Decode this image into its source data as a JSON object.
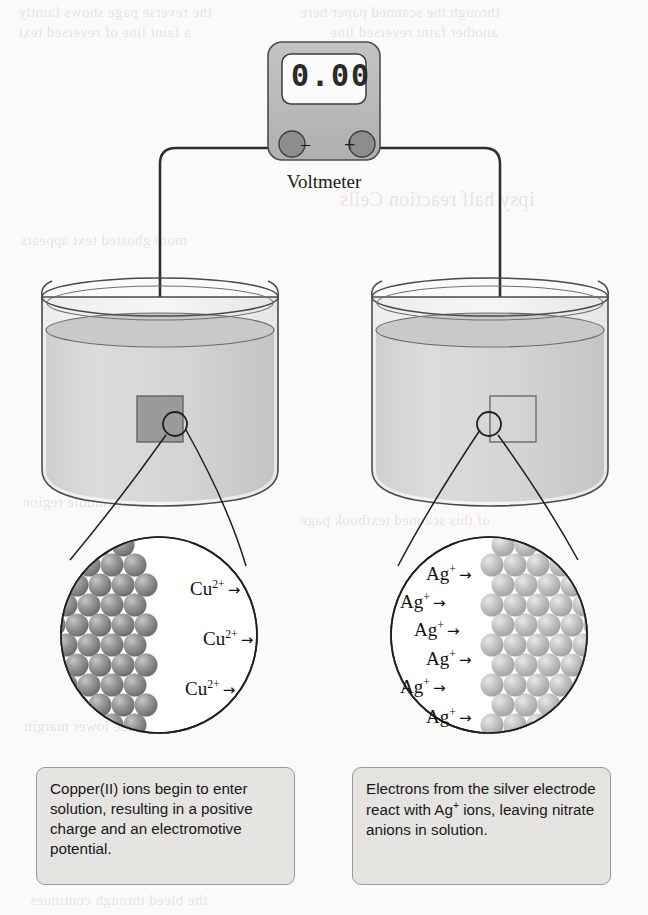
{
  "figure": {
    "background_color": "#fbfaf8"
  },
  "voltmeter": {
    "label": "Voltmeter",
    "display_value": "0.00",
    "negative_terminal": "−",
    "positive_terminal": "+",
    "body_color": "#b9b9b9",
    "screen_color": "#fbfbfb",
    "terminal_color": "#8d8d8d"
  },
  "left_cell": {
    "name": "copper-half-cell",
    "electrode_type": "filled",
    "electrode_color": "#9a9a9a",
    "solution_color": "#d7d7d7",
    "ion_labels": [
      {
        "species": "Cu",
        "charge": "2+",
        "arrow": "→"
      },
      {
        "species": "Cu",
        "charge": "2+",
        "arrow": "→"
      },
      {
        "species": "Cu",
        "charge": "2+",
        "arrow": "→"
      }
    ],
    "atom_color": "#8e8e8e",
    "caption": "Copper(II) ions begin to enter solution, resulting in a positive charge and an electromotive potential."
  },
  "right_cell": {
    "name": "silver-half-cell",
    "electrode_type": "outline",
    "electrode_color": "#ffffff",
    "solution_color": "#d7d7d7",
    "ion_labels": [
      {
        "species": "Ag",
        "charge": "+",
        "arrow": "→"
      },
      {
        "species": "Ag",
        "charge": "+",
        "arrow": "→"
      },
      {
        "species": "Ag",
        "charge": "+",
        "arrow": "→"
      },
      {
        "species": "Ag",
        "charge": "+",
        "arrow": "→"
      },
      {
        "species": "Ag",
        "charge": "+",
        "arrow": "→"
      },
      {
        "species": "Ag",
        "charge": "+",
        "arrow": "→"
      }
    ],
    "atom_color": "#bebebe",
    "caption_line1": "Electrons from the silver",
    "caption_line2_a": "electrode react with Ag",
    "caption_line2_sup": "+",
    "caption_line3": "ions, leaving nitrate anions",
    "caption_line4": "in solution."
  },
  "bleed_through_text": [
    "the reverse page shows faintly",
    "through the scanned paper here",
    "ipsy half reaction Cells",
    "a faint line of reversed text",
    "another faint reversed line",
    "more ghosted text appears",
    "across the middle region",
    "of this scanned textbook page",
    "and near the lower margin",
    "the bleed through continues"
  ]
}
